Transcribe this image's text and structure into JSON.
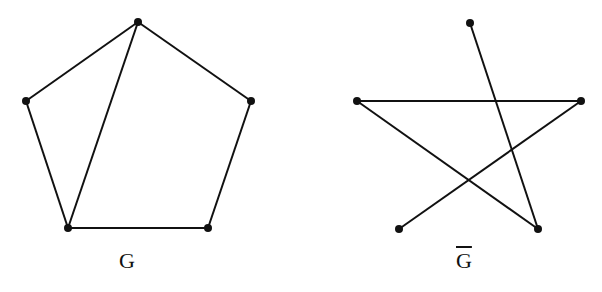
{
  "graphs": [
    {
      "label": "G",
      "overline": false,
      "vertices": [
        [
          138,
          22
        ],
        [
          26,
          101
        ],
        [
          251,
          101
        ],
        [
          68,
          228
        ],
        [
          208,
          228
        ]
      ],
      "edges": [
        [
          0,
          1
        ],
        [
          0,
          2
        ],
        [
          0,
          3
        ],
        [
          1,
          3
        ],
        [
          2,
          4
        ],
        [
          3,
          4
        ]
      ]
    },
    {
      "label": "G",
      "overline": true,
      "vertices": [
        [
          470,
          23
        ],
        [
          357,
          101
        ],
        [
          581,
          101
        ],
        [
          399,
          229
        ],
        [
          538,
          229
        ]
      ],
      "edges": [
        [
          0,
          4
        ],
        [
          1,
          2
        ],
        [
          1,
          4
        ],
        [
          2,
          3
        ]
      ]
    }
  ]
}
